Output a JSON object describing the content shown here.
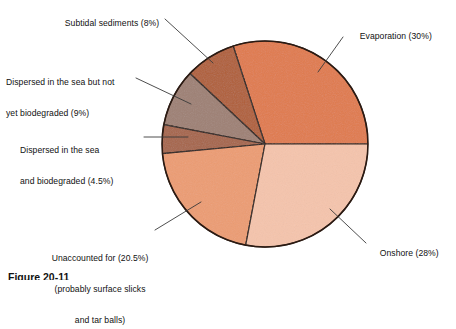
{
  "figure": {
    "caption": "Figure 20-11"
  },
  "chart_data": {
    "type": "pie",
    "title": "",
    "legend_position": "callout-labels",
    "grid": false,
    "units": "percent",
    "total": 100,
    "center": {
      "x": 265,
      "y": 144
    },
    "radius": 103,
    "start_angle_deg": 0,
    "direction": "counterclockwise",
    "categories": [
      "Evaporation",
      "Subtidal sediments",
      "Dispersed in the sea but not yet biodegraded",
      "Dispersed in the sea and biodegraded",
      "Unaccounted for (probably surface slicks and tar balls)",
      "Onshore"
    ],
    "values": [
      30,
      8,
      9,
      4.5,
      20.5,
      28
    ],
    "colors": [
      "#E07A4C",
      "#B05F38",
      "#9E8074",
      "#A6654A",
      "#EC9C72",
      "#F5C4AC"
    ],
    "slices": [
      {
        "name": "evaporation",
        "label": "Evaporation (30%)",
        "value": 30,
        "color": "#E07A4C",
        "start_deg": 0,
        "end_deg": 108
      },
      {
        "name": "subtidal-sediments",
        "label": "Subtidal sediments (8%)",
        "value": 8,
        "color": "#B05F38",
        "start_deg": 108,
        "end_deg": 136.8
      },
      {
        "name": "dispersed-not-yet-biodegraded",
        "label_line1": "Dispersed in the sea but not",
        "label_line2": "yet biodegraded (9%)",
        "value": 9,
        "color": "#9E8074",
        "start_deg": 136.8,
        "end_deg": 169.2
      },
      {
        "name": "dispersed-and-biodegraded",
        "label_line1": "Dispersed in the sea",
        "label_line2": "and biodegraded (4.5%)",
        "value": 4.5,
        "color": "#A6654A",
        "start_deg": 169.2,
        "end_deg": 185.4
      },
      {
        "name": "unaccounted-for",
        "label_line1": "Unaccounted for (20.5%)",
        "label_line2": "(probably surface slicks",
        "label_line3": "and tar balls)",
        "value": 20.5,
        "color": "#EC9C72",
        "start_deg": 185.4,
        "end_deg": 259.2
      },
      {
        "name": "onshore",
        "label": "Onshore (28%)",
        "value": 28,
        "color": "#F5C4AC",
        "start_deg": 259.2,
        "end_deg": 360
      }
    ],
    "outline_color": "#2b1a12",
    "leader_line_color": "#3a3a3a"
  },
  "labels": {
    "subtidal": "Subtidal sediments (8%)",
    "dispersed_not_l1": "Dispersed in the sea but not",
    "dispersed_not_l2": "yet biodegraded (9%)",
    "dispersed_bio_l1": "Dispersed in the sea",
    "dispersed_bio_l2": "and biodegraded (4.5%)",
    "unaccounted_l1": "Unaccounted for (20.5%)",
    "unaccounted_l2": "(probably surface slicks",
    "unaccounted_l3": "and tar balls)",
    "evaporation": "Evaporation (30%)",
    "onshore": "Onshore (28%)"
  }
}
